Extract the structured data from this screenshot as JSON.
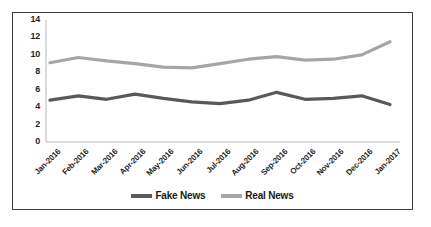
{
  "chart_data": {
    "type": "line",
    "title": "",
    "xlabel": "",
    "ylabel": "",
    "ylim": [
      0,
      14
    ],
    "yticks": [
      "0",
      "2",
      "4",
      "6",
      "8",
      "10",
      "12",
      "14"
    ],
    "grid": false,
    "legend_position": "bottom",
    "categories": [
      "Jan-2016",
      "Feb-2016",
      "Mar-2016",
      "Apr-2016",
      "May-2016",
      "Jun-2016",
      "Jul-2016",
      "Aug-2016",
      "Sep-2016",
      "Oct-2016",
      "Nov-2016",
      "Dec-2016",
      "Jan-2017"
    ],
    "series": [
      {
        "name": "Fake News",
        "color": "#595959",
        "values": [
          4.8,
          5.3,
          4.9,
          5.5,
          5.0,
          4.6,
          4.4,
          4.8,
          5.7,
          4.9,
          5.0,
          5.3,
          4.3
        ]
      },
      {
        "name": "Real News",
        "color": "#a6a6a6",
        "values": [
          9.1,
          9.7,
          9.3,
          9.0,
          8.6,
          8.5,
          9.0,
          9.5,
          9.8,
          9.4,
          9.5,
          10.0,
          11.5
        ]
      }
    ]
  },
  "axis": {
    "line_color": "#b0b0b0",
    "frame_color": "#3f3f3f"
  }
}
